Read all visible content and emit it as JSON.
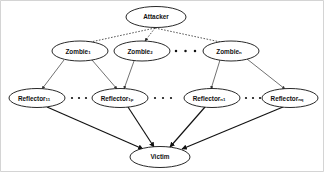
{
  "diagram": {
    "background_color": "#ffffff",
    "line_color": "#111111",
    "nodes": {
      "attacker": {
        "label": "Attacker",
        "subscript": "",
        "cx": 156,
        "cy": 17,
        "rx": 30,
        "ry": 10.5
      },
      "zombie_1": {
        "label": "Zombie",
        "subscript": "1",
        "cx": 80,
        "cy": 51,
        "rx": 28,
        "ry": 10
      },
      "zombie_2": {
        "label": "Zombie",
        "subscript": "2",
        "cx": 142,
        "cy": 51,
        "rx": 28,
        "ry": 10
      },
      "zombie_n": {
        "label": "Zombie",
        "subscript": "n",
        "cx": 231,
        "cy": 51,
        "rx": 28,
        "ry": 10
      },
      "reflector_11": {
        "label": "Reflector",
        "subscript": "11",
        "cx": 37,
        "cy": 98,
        "rx": 28,
        "ry": 9.5
      },
      "reflector_1p": {
        "label": "Reflector",
        "subscript": "1p",
        "cx": 120,
        "cy": 98,
        "rx": 28,
        "ry": 9.5
      },
      "reflector_n1": {
        "label": "Reflector",
        "subscript": "n1",
        "cx": 212,
        "cy": 98,
        "rx": 28,
        "ry": 9.5
      },
      "reflector_nq": {
        "label": "Reflector",
        "subscript": "nq",
        "cx": 290,
        "cy": 98,
        "rx": 28,
        "ry": 9.5
      },
      "victim": {
        "label": "Victim",
        "subscript": "",
        "cx": 160,
        "cy": 157,
        "rx": 30,
        "ry": 10.5
      }
    },
    "ellipses_groups": [
      {
        "name": "zombie-gap-dots",
        "count": 4,
        "x_start": 174,
        "y": 51,
        "spacing": 9.5
      },
      {
        "name": "reflector-gap-dots-left",
        "count": 3,
        "x_start": 70,
        "y": 98,
        "spacing": 6.5
      },
      {
        "name": "reflector-gap-dots-middle",
        "count": 3,
        "x_start": 152,
        "y": 98,
        "spacing": 8.0
      },
      {
        "name": "reflector-gap-dots-right",
        "count": 3,
        "x_start": 245,
        "y": 98,
        "spacing": 6.5
      }
    ],
    "edges": [
      {
        "name": "attacker-to-zombie-1",
        "style": "dotted",
        "from": "attacker",
        "to": "zombie_1"
      },
      {
        "name": "attacker-to-zombie-2",
        "style": "dotted",
        "from": "attacker",
        "to": "zombie_2"
      },
      {
        "name": "attacker-to-zombie-n",
        "style": "dotted",
        "from": "attacker",
        "to": "zombie_n"
      },
      {
        "name": "zombie-1-to-reflector-11",
        "style": "thin",
        "from": "zombie_1",
        "to": "reflector_11"
      },
      {
        "name": "zombie-1-to-reflector-1p",
        "style": "thin",
        "from": "zombie_1",
        "to": "reflector_1p"
      },
      {
        "name": "zombie-2-to-reflector-1p",
        "style": "thin",
        "from": "zombie_2",
        "to": "reflector_1p"
      },
      {
        "name": "zombie-n-to-reflector-n1",
        "style": "thin",
        "from": "zombie_n",
        "to": "reflector_n1"
      },
      {
        "name": "zombie-n-to-reflector-nq",
        "style": "thin",
        "from": "zombie_n",
        "to": "reflector_nq"
      },
      {
        "name": "reflector-11-to-victim",
        "style": "thick",
        "from": "reflector_11",
        "to": "victim"
      },
      {
        "name": "reflector-1p-to-victim",
        "style": "thick",
        "from": "reflector_1p",
        "to": "victim"
      },
      {
        "name": "reflector-n1-to-victim",
        "style": "thick",
        "from": "reflector_n1",
        "to": "victim"
      },
      {
        "name": "reflector-nq-to-victim",
        "style": "thick",
        "from": "reflector_nq",
        "to": "victim"
      }
    ]
  }
}
